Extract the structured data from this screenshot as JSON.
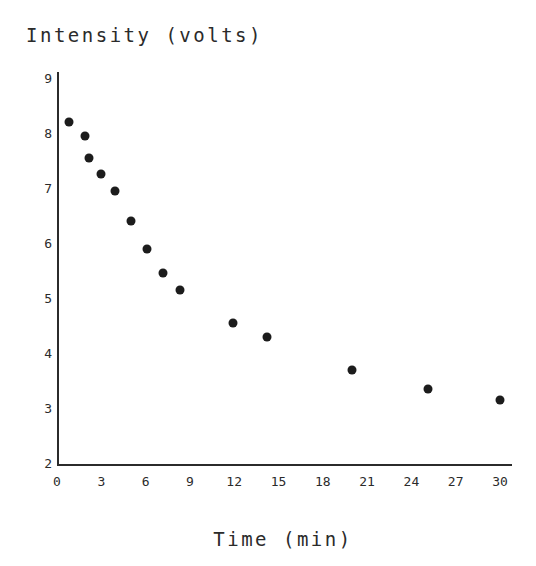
{
  "chart_data": {
    "type": "scatter",
    "title": "",
    "xlabel": "Time (min)",
    "ylabel": "Intensity (volts)",
    "xlim": [
      0,
      30
    ],
    "ylim": [
      2,
      9
    ],
    "grid": false,
    "legend": null,
    "marker": {
      "shape": "circle",
      "color": "#1c1c1c",
      "size_px": 9
    },
    "x_ticks": [
      0,
      3,
      6,
      9,
      12,
      15,
      18,
      21,
      24,
      27,
      30
    ],
    "x_tick_labels": [
      "0",
      "3",
      "6",
      "9",
      "12",
      "15",
      "18",
      "21",
      "24",
      "27",
      "30"
    ],
    "y_ticks": [
      2,
      3,
      4,
      5,
      6,
      7,
      8,
      9
    ],
    "y_tick_labels": [
      "2",
      "3",
      "4",
      "5",
      "6",
      "7",
      "8",
      "9"
    ],
    "series": [
      {
        "name": "Intensity decay",
        "x": [
          0.8,
          1.9,
          2.2,
          3.0,
          3.9,
          5.0,
          6.1,
          7.2,
          8.3,
          11.9,
          14.2,
          20.0,
          25.1,
          30.0
        ],
        "y": [
          8.2,
          7.95,
          7.55,
          7.25,
          6.95,
          6.4,
          5.9,
          5.45,
          5.15,
          4.55,
          4.3,
          3.7,
          3.35,
          3.15
        ]
      }
    ]
  },
  "axis_titles": {
    "y": "Intensity (volts)",
    "x": "Time (min)"
  }
}
